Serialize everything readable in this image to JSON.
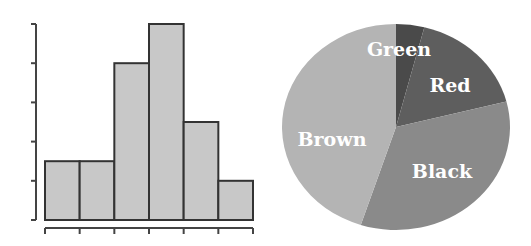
{
  "chart_data": [
    {
      "type": "bar",
      "subtype": "histogram",
      "title": "",
      "xlabel": "",
      "ylabel": "",
      "categories": [
        "bin1",
        "bin2",
        "bin3",
        "bin4",
        "bin5",
        "bin6"
      ],
      "values": [
        1.5,
        1.5,
        4,
        5,
        2.5,
        1
      ],
      "ylim": [
        0,
        5
      ],
      "y_ticks": 6,
      "x_ticks": 7,
      "tick_labels_shown": false,
      "grid": false,
      "bar_color": "#c8c8c8",
      "edge_color": "#333333"
    },
    {
      "type": "pie",
      "title": "",
      "labels": [
        "Green",
        "Red",
        "Black",
        "Brown"
      ],
      "values": [
        4,
        17,
        34,
        45
      ],
      "colors": [
        "#4a4a4a",
        "#5e5e5e",
        "#8a8a8a",
        "#b4b4b4"
      ],
      "start_angle_deg": 0,
      "direction": "clockwise",
      "legend": "none",
      "labels_inside": true
    }
  ]
}
